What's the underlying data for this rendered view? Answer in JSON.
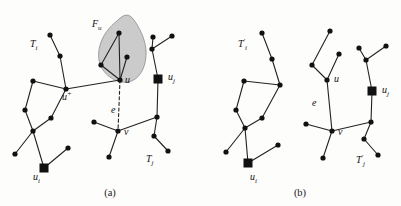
{
  "figure": {
    "background_color": "#fdfdfc",
    "node_color": "#111111",
    "edge_color": "#222222",
    "region_fill": "#c9c9c9",
    "region_stroke": "#7a7a7a",
    "panels": [
      {
        "id": "panel-a",
        "caption": "(a)",
        "caption_x": 110,
        "caption_y": 196,
        "labels": [
          {
            "name": "label-Ti",
            "base": "T",
            "sub": "i",
            "sup": "",
            "x": 30,
            "y": 47
          },
          {
            "name": "label-Fu",
            "base": "F",
            "sub": "u",
            "sup": "",
            "x": 92,
            "y": 27
          },
          {
            "name": "label-u",
            "base": "u",
            "sub": "",
            "sup": "",
            "x": 125,
            "y": 83
          },
          {
            "name": "label-uplus",
            "base": "u",
            "sub": "",
            "sup": "+",
            "x": 62,
            "y": 100
          },
          {
            "name": "label-e",
            "base": "e",
            "sub": "",
            "sup": "",
            "x": 111,
            "y": 113
          },
          {
            "name": "label-v",
            "base": "v",
            "sub": "",
            "sup": "",
            "x": 124,
            "y": 135
          },
          {
            "name": "label-uj",
            "base": "u",
            "sub": "j",
            "sup": "",
            "x": 168,
            "y": 80
          },
          {
            "name": "label-ui",
            "base": "u",
            "sub": "i",
            "sup": "",
            "x": 33,
            "y": 180
          },
          {
            "name": "label-Tj",
            "base": "T",
            "sub": "j",
            "sup": "",
            "x": 146,
            "y": 162
          }
        ],
        "region": {
          "name": "region-Fu",
          "path": "M 118 20 C 100 34, 96 52, 100 64 C 104 76, 118 84, 128 82 C 140 80, 147 66, 146 50 C 145 38, 139 27, 134 20 C 129 13, 124 14, 118 20 Z"
        },
        "square_nodes": [
          {
            "name": "node-ui",
            "x": 44,
            "y": 168,
            "size": 9
          },
          {
            "name": "node-uj",
            "x": 158,
            "y": 79,
            "size": 9
          }
        ],
        "round_nodes": [
          {
            "name": "node",
            "x": 50,
            "y": 35
          },
          {
            "name": "node",
            "x": 60,
            "y": 56
          },
          {
            "name": "node",
            "x": 66,
            "y": 89
          },
          {
            "name": "node",
            "x": 33,
            "y": 81
          },
          {
            "name": "node",
            "x": 25,
            "y": 110
          },
          {
            "name": "node",
            "x": 51,
            "y": 118
          },
          {
            "name": "node",
            "x": 33,
            "y": 131
          },
          {
            "name": "node",
            "x": 15,
            "y": 154
          },
          {
            "name": "node",
            "x": 68,
            "y": 148
          },
          {
            "name": "node",
            "x": 119,
            "y": 33
          },
          {
            "name": "node",
            "x": 127,
            "y": 57
          },
          {
            "name": "node",
            "x": 101,
            "y": 65
          },
          {
            "name": "node",
            "x": 120,
            "y": 80
          },
          {
            "name": "node",
            "x": 152,
            "y": 49
          },
          {
            "name": "node",
            "x": 153,
            "y": 37
          },
          {
            "name": "node",
            "x": 172,
            "y": 36
          },
          {
            "name": "node",
            "x": 118,
            "y": 131
          },
          {
            "name": "node",
            "x": 94,
            "y": 122
          },
          {
            "name": "node",
            "x": 109,
            "y": 157
          },
          {
            "name": "node",
            "x": 157,
            "y": 117
          },
          {
            "name": "node",
            "x": 154,
            "y": 136
          },
          {
            "name": "node",
            "x": 168,
            "y": 151
          }
        ],
        "edges": [
          {
            "name": "edge",
            "x1": 50,
            "y1": 35,
            "x2": 60,
            "y2": 56,
            "dashed": false
          },
          {
            "name": "edge",
            "x1": 60,
            "y1": 56,
            "x2": 66,
            "y2": 89,
            "dashed": false
          },
          {
            "name": "edge",
            "x1": 66,
            "y1": 89,
            "x2": 33,
            "y2": 81,
            "dashed": false
          },
          {
            "name": "edge",
            "x1": 33,
            "y1": 81,
            "x2": 25,
            "y2": 110,
            "dashed": false
          },
          {
            "name": "edge",
            "x1": 25,
            "y1": 110,
            "x2": 33,
            "y2": 131,
            "dashed": false
          },
          {
            "name": "edge",
            "x1": 66,
            "y1": 89,
            "x2": 51,
            "y2": 118,
            "dashed": false
          },
          {
            "name": "edge",
            "x1": 51,
            "y1": 118,
            "x2": 33,
            "y2": 131,
            "dashed": false
          },
          {
            "name": "edge",
            "x1": 33,
            "y1": 131,
            "x2": 15,
            "y2": 154,
            "dashed": false
          },
          {
            "name": "edge",
            "x1": 33,
            "y1": 131,
            "x2": 44,
            "y2": 168,
            "dashed": false
          },
          {
            "name": "edge",
            "x1": 44,
            "y1": 168,
            "x2": 68,
            "y2": 148,
            "dashed": false
          },
          {
            "name": "edge",
            "x1": 66,
            "y1": 89,
            "x2": 120,
            "y2": 80,
            "dashed": false
          },
          {
            "name": "edge",
            "x1": 120,
            "y1": 80,
            "x2": 119,
            "y2": 33,
            "dashed": false
          },
          {
            "name": "edge",
            "x1": 120,
            "y1": 80,
            "x2": 127,
            "y2": 57,
            "dashed": false
          },
          {
            "name": "edge",
            "x1": 120,
            "y1": 80,
            "x2": 101,
            "y2": 65,
            "dashed": false
          },
          {
            "name": "edge",
            "x1": 101,
            "y1": 65,
            "x2": 119,
            "y2": 33,
            "dashed": false
          },
          {
            "name": "edge",
            "x1": 120,
            "y1": 80,
            "x2": 118,
            "y2": 131,
            "dashed": true
          },
          {
            "name": "edge",
            "x1": 118,
            "y1": 131,
            "x2": 94,
            "y2": 122,
            "dashed": false
          },
          {
            "name": "edge",
            "x1": 118,
            "y1": 131,
            "x2": 109,
            "y2": 157,
            "dashed": false
          },
          {
            "name": "edge",
            "x1": 118,
            "y1": 131,
            "x2": 157,
            "y2": 117,
            "dashed": false
          },
          {
            "name": "edge",
            "x1": 157,
            "y1": 117,
            "x2": 158,
            "y2": 79,
            "dashed": false
          },
          {
            "name": "edge",
            "x1": 158,
            "y1": 79,
            "x2": 152,
            "y2": 49,
            "dashed": false
          },
          {
            "name": "edge",
            "x1": 152,
            "y1": 49,
            "x2": 153,
            "y2": 37,
            "dashed": false
          },
          {
            "name": "edge",
            "x1": 152,
            "y1": 49,
            "x2": 172,
            "y2": 36,
            "dashed": false
          },
          {
            "name": "edge",
            "x1": 157,
            "y1": 117,
            "x2": 154,
            "y2": 136,
            "dashed": false
          },
          {
            "name": "edge",
            "x1": 154,
            "y1": 136,
            "x2": 168,
            "y2": 151,
            "dashed": false
          }
        ]
      },
      {
        "id": "panel-b",
        "caption": "(b)",
        "caption_x": 300,
        "caption_y": 196,
        "labels": [
          {
            "name": "label-Tip",
            "base": "T",
            "sub": "i",
            "sup": "′",
            "x": 238,
            "y": 47
          },
          {
            "name": "label-u",
            "base": "u",
            "sub": "",
            "sup": "",
            "x": 334,
            "y": 82
          },
          {
            "name": "label-e",
            "base": "e",
            "sub": "",
            "sup": "",
            "x": 312,
            "y": 106
          },
          {
            "name": "label-v",
            "base": "v",
            "sub": "",
            "sup": "",
            "x": 338,
            "y": 135
          },
          {
            "name": "label-uj",
            "base": "u",
            "sub": "j",
            "sup": "",
            "x": 382,
            "y": 93
          },
          {
            "name": "label-ui",
            "base": "u",
            "sub": "i",
            "sup": "",
            "x": 250,
            "y": 180
          },
          {
            "name": "label-Tjp",
            "base": "T",
            "sub": "j",
            "sup": "′",
            "x": 356,
            "y": 163
          }
        ],
        "region": null,
        "square_nodes": [
          {
            "name": "node-ui",
            "x": 248,
            "y": 163,
            "size": 9
          },
          {
            "name": "node-uj",
            "x": 372,
            "y": 91,
            "size": 9
          }
        ],
        "round_nodes": [
          {
            "name": "node",
            "x": 262,
            "y": 33
          },
          {
            "name": "node",
            "x": 272,
            "y": 59
          },
          {
            "name": "node",
            "x": 280,
            "y": 85
          },
          {
            "name": "node",
            "x": 244,
            "y": 81
          },
          {
            "name": "node",
            "x": 236,
            "y": 110
          },
          {
            "name": "node",
            "x": 262,
            "y": 118
          },
          {
            "name": "node",
            "x": 245,
            "y": 128
          },
          {
            "name": "node",
            "x": 226,
            "y": 152
          },
          {
            "name": "node",
            "x": 278,
            "y": 145
          },
          {
            "name": "node",
            "x": 330,
            "y": 31
          },
          {
            "name": "node",
            "x": 339,
            "y": 54
          },
          {
            "name": "node",
            "x": 312,
            "y": 65
          },
          {
            "name": "node",
            "x": 327,
            "y": 80
          },
          {
            "name": "node",
            "x": 366,
            "y": 60
          },
          {
            "name": "node",
            "x": 359,
            "y": 48
          },
          {
            "name": "node",
            "x": 386,
            "y": 46
          },
          {
            "name": "node",
            "x": 332,
            "y": 131
          },
          {
            "name": "node",
            "x": 306,
            "y": 124
          },
          {
            "name": "node",
            "x": 323,
            "y": 158
          },
          {
            "name": "node",
            "x": 371,
            "y": 122
          },
          {
            "name": "node",
            "x": 364,
            "y": 139
          },
          {
            "name": "node",
            "x": 378,
            "y": 155
          }
        ],
        "edges": [
          {
            "name": "edge",
            "x1": 262,
            "y1": 33,
            "x2": 272,
            "y2": 59,
            "dashed": false
          },
          {
            "name": "edge",
            "x1": 272,
            "y1": 59,
            "x2": 280,
            "y2": 85,
            "dashed": false
          },
          {
            "name": "edge",
            "x1": 280,
            "y1": 85,
            "x2": 244,
            "y2": 81,
            "dashed": false
          },
          {
            "name": "edge",
            "x1": 244,
            "y1": 81,
            "x2": 236,
            "y2": 110,
            "dashed": false
          },
          {
            "name": "edge",
            "x1": 236,
            "y1": 110,
            "x2": 245,
            "y2": 128,
            "dashed": false
          },
          {
            "name": "edge",
            "x1": 280,
            "y1": 85,
            "x2": 262,
            "y2": 118,
            "dashed": false
          },
          {
            "name": "edge",
            "x1": 262,
            "y1": 118,
            "x2": 245,
            "y2": 128,
            "dashed": false
          },
          {
            "name": "edge",
            "x1": 245,
            "y1": 128,
            "x2": 226,
            "y2": 152,
            "dashed": false
          },
          {
            "name": "edge",
            "x1": 245,
            "y1": 128,
            "x2": 248,
            "y2": 163,
            "dashed": false
          },
          {
            "name": "edge",
            "x1": 248,
            "y1": 163,
            "x2": 278,
            "y2": 145,
            "dashed": false
          },
          {
            "name": "edge",
            "x1": 327,
            "y1": 80,
            "x2": 339,
            "y2": 54,
            "dashed": false
          },
          {
            "name": "edge",
            "x1": 327,
            "y1": 80,
            "x2": 312,
            "y2": 65,
            "dashed": false
          },
          {
            "name": "edge",
            "x1": 312,
            "y1": 65,
            "x2": 330,
            "y2": 31,
            "dashed": false
          },
          {
            "name": "edge",
            "x1": 327,
            "y1": 80,
            "x2": 332,
            "y2": 131,
            "dashed": false
          },
          {
            "name": "edge",
            "x1": 332,
            "y1": 131,
            "x2": 306,
            "y2": 124,
            "dashed": false
          },
          {
            "name": "edge",
            "x1": 332,
            "y1": 131,
            "x2": 323,
            "y2": 158,
            "dashed": false
          },
          {
            "name": "edge",
            "x1": 332,
            "y1": 131,
            "x2": 371,
            "y2": 122,
            "dashed": false
          },
          {
            "name": "edge",
            "x1": 371,
            "y1": 122,
            "x2": 372,
            "y2": 91,
            "dashed": false
          },
          {
            "name": "edge",
            "x1": 372,
            "y1": 91,
            "x2": 366,
            "y2": 60,
            "dashed": false
          },
          {
            "name": "edge",
            "x1": 366,
            "y1": 60,
            "x2": 359,
            "y2": 48,
            "dashed": false
          },
          {
            "name": "edge",
            "x1": 366,
            "y1": 60,
            "x2": 386,
            "y2": 46,
            "dashed": false
          },
          {
            "name": "edge",
            "x1": 371,
            "y1": 122,
            "x2": 364,
            "y2": 139,
            "dashed": false
          },
          {
            "name": "edge",
            "x1": 364,
            "y1": 139,
            "x2": 378,
            "y2": 155,
            "dashed": false
          }
        ]
      }
    ]
  }
}
